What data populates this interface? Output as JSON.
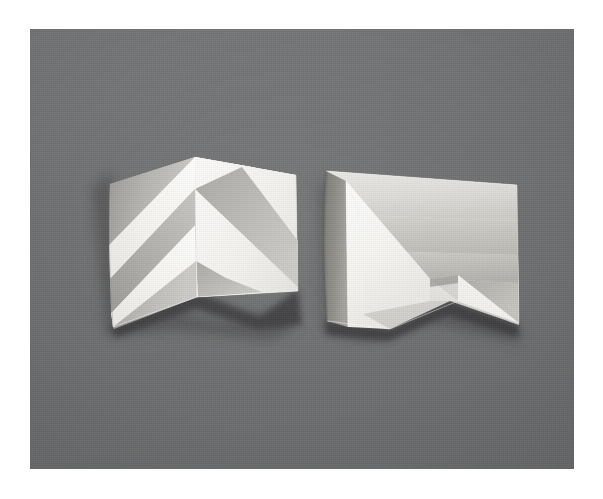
{
  "scene": {
    "title": "Two folded paper models photographed on a gray backdrop",
    "medium": "photograph",
    "subject": "origami / paper-folding study",
    "object_count": 2,
    "background_color": "#6f7071",
    "border_color": "#ffffff",
    "paper_color": "#f2f1ee",
    "shadow_color": "#3b3c3d",
    "photo_area": {
      "x": 30,
      "y": 29,
      "width": 544,
      "height": 440
    }
  },
  "objects": [
    {
      "id": "left-model",
      "name": "chevron-pleat-model",
      "description": "Square sheet folded down a central vertical mountain fold, with mirrored diagonal pleats forming a chevron / herringbone pattern",
      "pattern": "chevron",
      "band_count": 4,
      "bounds": {
        "x": 110,
        "y": 155,
        "width": 190,
        "height": 170
      },
      "facets": [
        {
          "name": "left-wing",
          "tone": "mid-gray",
          "color": "#b9b8b4"
        },
        {
          "name": "right-wing",
          "tone": "bright-white",
          "color": "#f4f3f0"
        },
        {
          "name": "diagonal-band-light",
          "color": "#f6f5f2"
        },
        {
          "name": "diagonal-band-shade",
          "color": "#acaba7"
        }
      ]
    },
    {
      "id": "right-model",
      "name": "angular-fold-model",
      "description": "Square sheet with a tall vertical valley fold at left and a stepped diagonal fold at center-right, creating a bright facing panel and receding shaded planes",
      "pattern": "stepped-diagonal",
      "band_count": 3,
      "bounds": {
        "x": 324,
        "y": 165,
        "width": 190,
        "height": 160
      },
      "facets": [
        {
          "name": "left-return-flap",
          "tone": "dark-gray",
          "color": "#8e8d8a"
        },
        {
          "name": "front-panel",
          "tone": "bright-white",
          "color": "#f6f5f2"
        },
        {
          "name": "upper-recess",
          "tone": "light-gray",
          "color": "#d5d4d0"
        },
        {
          "name": "lower-recess",
          "tone": "mid-gray",
          "color": "#bcbbb7"
        }
      ]
    }
  ],
  "lighting": {
    "key_light_direction": "upper-right",
    "cast_shadow": "below each model, falling to the lower-left"
  }
}
